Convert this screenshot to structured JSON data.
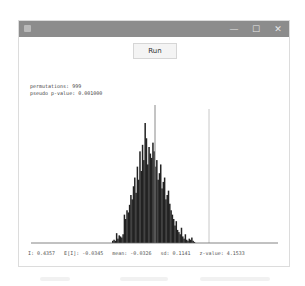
{
  "window": {
    "title": "",
    "controls": {
      "minimize": "—",
      "maximize": "☐",
      "close": "✕"
    },
    "titlebar_color": "#8c8c8c"
  },
  "toolbar": {
    "run_label": "Run"
  },
  "summary": {
    "permutations": "permutations: 999",
    "pseudo_p_value": "pseudo p-value: 0.001000"
  },
  "footer": {
    "stats": "I: 0.4357   E[I]: -0.0345   mean: -0.0326   sd: 0.1141   z-value: 4.1533"
  },
  "chart_data": {
    "type": "bar",
    "xlabel": "",
    "ylabel": "",
    "x_range_px": [
      111,
      194
    ],
    "bar_color": "#222222",
    "values": [
      2,
      3,
      2,
      9,
      4,
      7,
      6,
      5,
      8,
      26,
      22,
      30,
      28,
      35,
      44,
      40,
      52,
      60,
      46,
      70,
      58,
      84,
      66,
      90,
      76,
      110,
      96,
      72,
      88,
      82,
      78,
      92,
      84,
      70,
      76,
      58,
      64,
      72,
      50,
      56,
      60,
      40,
      44,
      48,
      36,
      30,
      26,
      22,
      16,
      20,
      12,
      10,
      8,
      14,
      6,
      4,
      8,
      3,
      2,
      4,
      3,
      5,
      2,
      1
    ],
    "reference_lines": [
      {
        "name": "mean",
        "value": -0.0326,
        "color": "#8a8a8a"
      },
      {
        "name": "observed I",
        "value": 0.4357,
        "color": "#c8c8c8"
      }
    ]
  },
  "below_window": {
    "faint_text": ""
  }
}
